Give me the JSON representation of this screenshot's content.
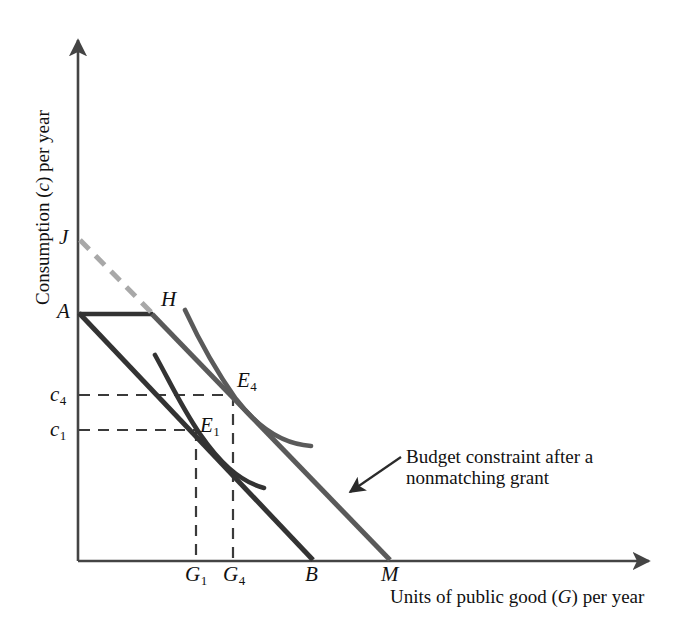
{
  "figure": {
    "type": "economics-indifference-curve-diagram",
    "background_color": "#ffffff",
    "axes": {
      "y_title": "Consumption (c) per year",
      "y_title_plain": "Consumption",
      "y_title_italic_symbol": "c",
      "x_title": "Units of public good (G) per year",
      "x_title_italic_symbol": "G",
      "axis_color": "#444444"
    },
    "annotation": {
      "line1": "Budget constraint after a",
      "line2": "nonmatching grant"
    },
    "point_labels": {
      "J": "J",
      "A": "A",
      "H": "H",
      "B": "B",
      "M": "M",
      "E4_base": "E",
      "E4_sub": "4",
      "E1_base": "E",
      "E1_sub": "1",
      "c4_base": "c",
      "c4_sub": "4",
      "c1_base": "c",
      "c1_sub": "1",
      "G1_base": "G",
      "G1_sub": "1",
      "G4_base": "G",
      "G4_sub": "4"
    },
    "colors": {
      "dark_line": "#333333",
      "gray_line": "#5a5a5a",
      "dashed_light": "#a8a8a8",
      "dashed_dark": "#3a3a3a",
      "axis": "#444444",
      "text": "#111111"
    }
  },
  "chart_data": {
    "type": "line",
    "title": "",
    "xlabel": "Units of public good (G) per year",
    "ylabel": "Consumption (c) per year",
    "grid": false,
    "legend": "none",
    "axis_origin_px": [
      78,
      561
    ],
    "axis_x_end_px": [
      655,
      561
    ],
    "axis_y_end_px": [
      78,
      35
    ],
    "series": [
      {
        "name": "Original budget constraint A-B",
        "style": "solid",
        "color": "#333333",
        "points_px": [
          [
            78,
            313
          ],
          [
            313,
            561
          ]
        ]
      },
      {
        "name": "Budget constraint after a nonmatching grant (J-H-M)",
        "style": "solid-with-dashed-segment",
        "color": "#5a5a5a",
        "dashed_segment_px": [
          [
            78,
            240
          ],
          [
            152,
            314
          ]
        ],
        "solid_segment_px": [
          [
            152,
            314
          ],
          [
            390,
            561
          ]
        ]
      },
      {
        "name": "Lump-sum segment A-H",
        "style": "solid",
        "color": "#333333",
        "points_px": [
          [
            78,
            314
          ],
          [
            152,
            314
          ]
        ]
      },
      {
        "name": "Indifference curve through E1",
        "style": "curve",
        "color": "#333333",
        "points_px": [
          [
            155,
            355
          ],
          [
            180,
            398
          ],
          [
            205,
            440
          ],
          [
            235,
            473
          ],
          [
            263,
            488
          ]
        ]
      },
      {
        "name": "Indifference curve through E4",
        "style": "curve",
        "color": "#5a5a5a",
        "points_px": [
          [
            185,
            310
          ],
          [
            208,
            355
          ],
          [
            233,
            397
          ],
          [
            268,
            432
          ],
          [
            310,
            445
          ]
        ]
      }
    ],
    "equilibrium_points": [
      {
        "label": "E1",
        "x_px": 196,
        "y_px": 430,
        "c_label": "c1",
        "g_label": "G1"
      },
      {
        "label": "E4",
        "x_px": 233,
        "y_px": 397,
        "c_label": "c4",
        "g_label": "G4"
      }
    ],
    "axis_intercepts": [
      {
        "label": "J",
        "axis": "y",
        "px": [
          78,
          240
        ]
      },
      {
        "label": "A",
        "axis": "y",
        "px": [
          78,
          313
        ]
      },
      {
        "label": "H",
        "axis": "kink",
        "px": [
          152,
          314
        ]
      },
      {
        "label": "B",
        "axis": "x",
        "px": [
          313,
          561
        ]
      },
      {
        "label": "M",
        "axis": "x",
        "px": [
          390,
          561
        ]
      }
    ],
    "guide_lines": [
      {
        "from": "c4",
        "to": "E4",
        "style": "dashed",
        "px": [
          [
            78,
            395
          ],
          [
            233,
            395
          ]
        ]
      },
      {
        "from": "c1",
        "to": "E1",
        "style": "dashed",
        "px": [
          [
            78,
            430
          ],
          [
            196,
            430
          ]
        ]
      },
      {
        "from": "E4",
        "to": "G4",
        "style": "dashed",
        "px": [
          [
            233,
            395
          ],
          [
            233,
            561
          ]
        ]
      },
      {
        "from": "E1",
        "to": "G1",
        "style": "dashed",
        "px": [
          [
            196,
            430
          ],
          [
            196,
            561
          ]
        ]
      }
    ],
    "annotation_arrow_px": {
      "tail": [
        400,
        458
      ],
      "head": [
        349,
        492
      ]
    }
  }
}
